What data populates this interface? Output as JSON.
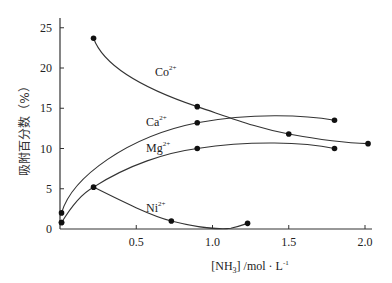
{
  "chart_data": {
    "type": "line",
    "title": "",
    "xlabel": "[NH3] /mol·L-1",
    "xlabel_parts": {
      "pre": "[NH",
      "sub": "3",
      "mid": "] /mol · L",
      "sup": "-1"
    },
    "ylabel": "吸附百分数（%）",
    "xlim": [
      0,
      2.05
    ],
    "ylim": [
      0,
      26
    ],
    "x_ticks": [
      0.5,
      1.0,
      1.5,
      2.0
    ],
    "x_tick_labels": [
      "0.5",
      "1.0",
      "1.5",
      "2.0"
    ],
    "y_ticks": [
      0,
      5,
      10,
      15,
      20,
      25
    ],
    "y_tick_labels": [
      "0",
      "5",
      "10",
      "15",
      "20",
      "25"
    ],
    "grid": false,
    "legend": "inline labels",
    "series": [
      {
        "name": "Co2+",
        "label_base": "Co",
        "label_sup": "2+",
        "x": [
          0.22,
          0.9,
          1.5,
          2.02
        ],
        "y": [
          23.7,
          15.2,
          11.8,
          10.6
        ]
      },
      {
        "name": "Ca2+",
        "label_base": "Ca",
        "label_sup": "2+",
        "x": [
          0.01,
          0.9,
          1.8
        ],
        "y": [
          2.0,
          13.2,
          13.5
        ]
      },
      {
        "name": "Mg2+",
        "label_base": "Mg",
        "label_sup": "2+",
        "x": [
          0.01,
          0.9,
          1.8
        ],
        "y": [
          0.8,
          10.0,
          10.0
        ]
      },
      {
        "name": "Ni2+",
        "label_base": "Ni",
        "label_sup": "2+",
        "x": [
          0.01,
          0.22,
          0.73,
          1.23
        ],
        "y": [
          0.8,
          5.2,
          1.0,
          0.7
        ]
      }
    ]
  }
}
